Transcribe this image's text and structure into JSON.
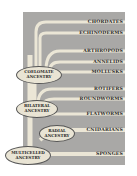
{
  "diagram": {
    "type": "phylogenetic-tree",
    "colors": {
      "background": "#a9a8a6",
      "branch": "#ebe6d6",
      "node_fill": "#e9e4d4",
      "node_border": "#555555",
      "text": "#2a2a2a"
    },
    "taxa": [
      {
        "label": "CHORDATES"
      },
      {
        "label": "ECHINODERMS"
      },
      {
        "label": "ARTHROPODS"
      },
      {
        "label": "ANNELIDS"
      },
      {
        "label": "MOLLUSKS"
      },
      {
        "label": "ROTIFERS"
      },
      {
        "label": "ROUNDWORMS"
      },
      {
        "label": "FLATWORMS"
      },
      {
        "label": "CNIDARIANS"
      },
      {
        "label": "SPONGES"
      }
    ],
    "nodes": {
      "coelomate": {
        "line1": "COELOMATE",
        "line2": "ANCESTRY"
      },
      "bilateral": {
        "line1": "BILATERAL",
        "line2": "ANCESTRY"
      },
      "radial": {
        "line1": "RADIAL",
        "line2": "ANCESTRY"
      },
      "multicelled": {
        "line1": "MULTICELLED",
        "line2": "ANCESTRY"
      }
    }
  }
}
